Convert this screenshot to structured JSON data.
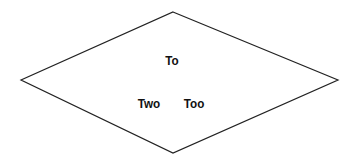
{
  "diagram": {
    "shape": "diamond",
    "stroke_color": "#222222",
    "fill_color": "#ffffff",
    "vertices": {
      "top": [
        173,
        12
      ],
      "right": [
        338,
        80
      ],
      "bottom": [
        173,
        153
      ],
      "left": [
        21,
        80
      ]
    },
    "labels": [
      {
        "text": "To",
        "x": 172,
        "y": 60
      },
      {
        "text": "Two",
        "x": 149,
        "y": 103
      },
      {
        "text": "Too",
        "x": 194,
        "y": 103
      }
    ]
  }
}
